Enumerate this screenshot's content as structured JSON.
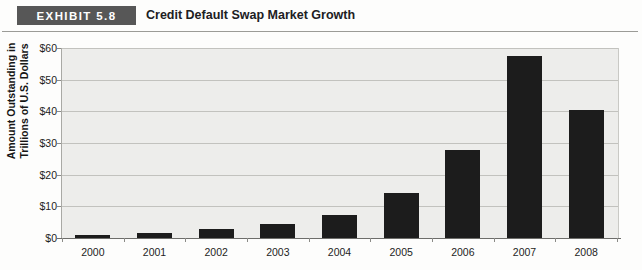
{
  "header": {
    "badge_label": "EXHIBIT 5.8",
    "title": "Credit Default Swap Market Growth"
  },
  "chart_data": {
    "type": "bar",
    "title": "Credit Default Swap Market Growth",
    "categories": [
      "2000",
      "2001",
      "2002",
      "2003",
      "2004",
      "2005",
      "2006",
      "2007",
      "2008"
    ],
    "values": [
      0.9,
      1.6,
      2.9,
      4.5,
      7.4,
      14.2,
      27.8,
      57.4,
      40.5
    ],
    "xlabel": "",
    "ylabel": "Amount Outstanding in Trillions of U.S. Dollars",
    "ylabel_line1": "Amount Outstanding in",
    "ylabel_line2": "Trillions of U.S. Dollars",
    "ylim": [
      0,
      60
    ],
    "ytick_values": [
      0,
      10,
      20,
      30,
      40,
      50,
      60
    ],
    "ytick_labels": [
      "$0",
      "$10",
      "$20",
      "$30",
      "$40",
      "$50",
      "$60"
    ],
    "grid": true,
    "legend": null,
    "bar_color": "#1c1c1c",
    "plot_background": "#ededeb",
    "gridline_color": "#c2c2be"
  }
}
